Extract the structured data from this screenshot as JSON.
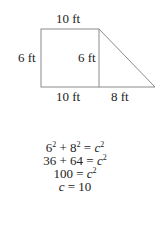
{
  "diagram": {
    "labels": {
      "top": "10 ft",
      "left": "6 ft",
      "inner_right": "6 ft",
      "bottom_left": "10 ft",
      "bottom_right": "8 ft"
    },
    "shapes": {
      "rectangle": {
        "x": 41,
        "y": 29,
        "width": 58,
        "height": 58
      },
      "triangle": {
        "points": [
          [
            99,
            29
          ],
          [
            155,
            87
          ],
          [
            99,
            87
          ]
        ]
      }
    },
    "stroke_color": "#8a8a8a"
  },
  "equations": [
    {
      "a": "6",
      "a_exp": "2",
      "op": " + ",
      "b": "8",
      "b_exp": "2",
      "eq": " = ",
      "var": "c",
      "var_exp": "2"
    },
    {
      "text": "36 + 64 = ",
      "var": "c",
      "var_exp": "2"
    },
    {
      "text": "100 = ",
      "var": "c",
      "var_exp": "2"
    },
    {
      "var": "c",
      "rest": " = 10"
    }
  ]
}
